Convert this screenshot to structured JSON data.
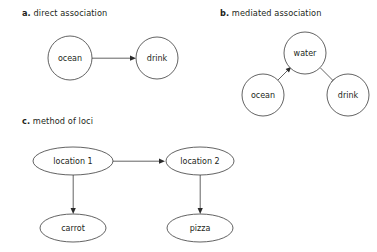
{
  "figure": {
    "background_color": "#ffffff",
    "stroke_color": "#3b3b3b",
    "text_color": "#231f20"
  },
  "panels": [
    {
      "id": "a",
      "letter": "a.",
      "caption": " direct association",
      "nodes": [
        {
          "id": "a-ocean",
          "label": "ocean",
          "shape": "circle",
          "cx": 70,
          "cy": 58,
          "rx": 22,
          "ry": 22
        },
        {
          "id": "a-drink",
          "label": "drink",
          "shape": "circle",
          "cx": 157,
          "cy": 58,
          "rx": 21,
          "ry": 21
        }
      ],
      "edges": [
        {
          "id": "a-ocean-to-drink",
          "from": "ocean",
          "to": "drink"
        }
      ]
    },
    {
      "id": "b",
      "letter": "b.",
      "caption": " mediated association",
      "nodes": [
        {
          "id": "b-water",
          "label": "water",
          "shape": "circle",
          "cx": 305,
          "cy": 53,
          "rx": 21,
          "ry": 21
        },
        {
          "id": "b-ocean",
          "label": "ocean",
          "shape": "circle",
          "cx": 263,
          "cy": 95,
          "rx": 21,
          "ry": 21
        },
        {
          "id": "b-drink",
          "label": "drink",
          "shape": "circle",
          "cx": 348,
          "cy": 95,
          "rx": 21,
          "ry": 21
        }
      ],
      "edges": [
        {
          "id": "b-ocean-to-water",
          "from": "ocean",
          "to": "water"
        },
        {
          "id": "b-water-to-drink",
          "from": "water",
          "to": "drink"
        }
      ]
    },
    {
      "id": "c",
      "letter": "c.",
      "caption": " method of loci",
      "nodes": [
        {
          "id": "c-location-1",
          "label": "location 1",
          "shape": "ellipse",
          "cx": 73,
          "cy": 161,
          "rx": 40,
          "ry": 14
        },
        {
          "id": "c-location-2",
          "label": "location 2",
          "shape": "ellipse",
          "cx": 200,
          "cy": 161,
          "rx": 34,
          "ry": 14
        },
        {
          "id": "c-carrot",
          "label": "carrot",
          "shape": "ellipse",
          "cx": 73,
          "cy": 228,
          "rx": 33,
          "ry": 14
        },
        {
          "id": "c-pizza",
          "label": "pizza",
          "shape": "ellipse",
          "cx": 200,
          "cy": 228,
          "rx": 33,
          "ry": 14
        }
      ],
      "edges": [
        {
          "id": "c-loc1-to-loc2",
          "from": "location 1",
          "to": "location 2"
        },
        {
          "id": "c-loc1-to-carrot",
          "from": "location 1",
          "to": "carrot"
        },
        {
          "id": "c-loc2-to-pizza",
          "from": "location 2",
          "to": "pizza"
        }
      ]
    }
  ],
  "captions": {
    "a_letter": "a.",
    "a_text": " direct association",
    "b_letter": "b.",
    "b_text": " mediated association",
    "c_letter": "c.",
    "c_text": " method of loci"
  },
  "labels": {
    "a_ocean": "ocean",
    "a_drink": "drink",
    "b_water": "water",
    "b_ocean": "ocean",
    "b_drink": "drink",
    "c_location_1": "location 1",
    "c_location_2": "location 2",
    "c_carrot": "carrot",
    "c_pizza": "pizza"
  }
}
